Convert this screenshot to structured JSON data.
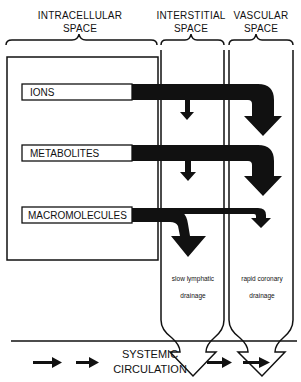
{
  "headers": {
    "intracellular": [
      "INTRACELLULAR",
      "SPACE"
    ],
    "interstitial": [
      "INTERSTITIAL",
      "SPACE"
    ],
    "vascular": [
      "VASCULAR",
      "SPACE"
    ]
  },
  "substances": [
    {
      "label": "IONS"
    },
    {
      "label": "METABOLITES"
    },
    {
      "label": "MACROMOLECULES"
    }
  ],
  "drainage": {
    "lymphatic": [
      "slow lymphatic",
      "drainage"
    ],
    "coronary": [
      "rapid coronary",
      "drainage"
    ]
  },
  "footer": [
    "SYSTEMIC",
    "CIRCULATION"
  ],
  "colors": {
    "ink": "#111111",
    "paper": "#ffffff"
  }
}
